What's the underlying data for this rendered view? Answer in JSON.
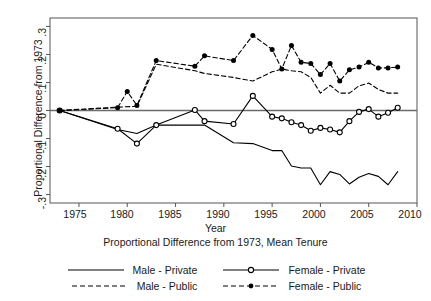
{
  "axes": {
    "ylabel": "Proportional Difference from 1973",
    "xlabel": "Year",
    "subtitle": "Proportional Difference from 1973, Mean Tenure",
    "yticks": [
      ".3",
      ".2",
      ".1",
      "0",
      "-.1",
      "-.2",
      "-.3"
    ],
    "xticks": [
      "1975",
      "1980",
      "1985",
      "1990",
      "1995",
      "2000",
      "2005",
      "2010"
    ]
  },
  "legend": {
    "entries": [
      {
        "label": "Male - Private",
        "style": "solid",
        "marker": "none"
      },
      {
        "label": "Female - Private",
        "style": "solid",
        "marker": "open"
      },
      {
        "label": "Male - Public",
        "style": "dashed",
        "marker": "none"
      },
      {
        "label": "Female - Public",
        "style": "dashed",
        "marker": "filled"
      }
    ]
  },
  "chart_data": {
    "type": "line",
    "title": "",
    "subtitle": "Proportional Difference from 1973, Mean Tenure",
    "xlabel": "Year",
    "ylabel": "Proportional Difference from 1973",
    "xlim": [
      1972.0,
      2010.0
    ],
    "ylim": [
      -0.33,
      0.33
    ],
    "grid": false,
    "zero_line": true,
    "legend_position": "below",
    "series": [
      {
        "name": "Male - Private",
        "style": "solid",
        "marker": "none",
        "color": "#000000",
        "x": [
          1973,
          1979,
          1981,
          1983,
          1987,
          1988,
          1991,
          1993,
          1995,
          1996,
          1997,
          1998,
          1999,
          2000,
          2001,
          2002,
          2003,
          2004,
          2005,
          2006,
          2007,
          2008
        ],
        "y": [
          0.0,
          -0.068,
          -0.082,
          -0.052,
          -0.052,
          -0.052,
          -0.115,
          -0.118,
          -0.143,
          -0.143,
          -0.198,
          -0.205,
          -0.205,
          -0.265,
          -0.218,
          -0.228,
          -0.262,
          -0.238,
          -0.225,
          -0.235,
          -0.265,
          -0.218
        ]
      },
      {
        "name": "Female - Private",
        "style": "solid",
        "marker": "open",
        "color": "#000000",
        "x": [
          1973,
          1979,
          1981,
          1983,
          1987,
          1988,
          1991,
          1993,
          1995,
          1996,
          1997,
          1998,
          1999,
          2000,
          2001,
          2002,
          2003,
          2004,
          2005,
          2006,
          2007,
          2008
        ],
        "y": [
          0.0,
          -0.065,
          -0.118,
          -0.052,
          0.002,
          -0.038,
          -0.048,
          0.052,
          -0.022,
          -0.028,
          -0.042,
          -0.052,
          -0.072,
          -0.062,
          -0.068,
          -0.078,
          -0.038,
          -0.005,
          0.005,
          -0.022,
          -0.008,
          0.01
        ]
      },
      {
        "name": "Male - Public",
        "style": "dashed",
        "marker": "none",
        "color": "#000000",
        "x": [
          1973,
          1979,
          1981,
          1983,
          1987,
          1988,
          1991,
          1993,
          1995,
          1996,
          1997,
          1998,
          1999,
          2000,
          2001,
          2002,
          2003,
          2004,
          2005,
          2006,
          2007,
          2008
        ],
        "y": [
          0.0,
          0.012,
          0.015,
          0.165,
          0.142,
          0.132,
          0.118,
          0.105,
          0.138,
          0.148,
          0.142,
          0.138,
          0.118,
          0.062,
          0.09,
          0.062,
          0.062,
          0.088,
          0.098,
          0.075,
          0.062,
          0.062
        ]
      },
      {
        "name": "Female - Public",
        "style": "dashed",
        "marker": "filled",
        "color": "#000000",
        "x": [
          1973,
          1979,
          1980,
          1981,
          1983,
          1987,
          1988,
          1991,
          1993,
          1995,
          1996,
          1997,
          1998,
          1999,
          2000,
          2001,
          2002,
          2003,
          2004,
          2005,
          2006,
          2007,
          2008
        ],
        "y": [
          0.0,
          0.01,
          0.068,
          0.018,
          0.178,
          0.158,
          0.195,
          0.178,
          0.268,
          0.218,
          0.148,
          0.232,
          0.172,
          0.168,
          0.128,
          0.168,
          0.105,
          0.145,
          0.155,
          0.172,
          0.152,
          0.152,
          0.155
        ]
      }
    ]
  }
}
